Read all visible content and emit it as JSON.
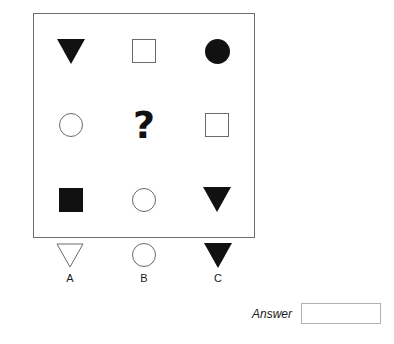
{
  "puzzle": {
    "type": "matrix-reasoning",
    "matrix": {
      "rows": 3,
      "columns": 3,
      "cells": [
        {
          "id": "r1c1",
          "shape": "triangle-down",
          "fill": "filled",
          "icon_name": "triangle-down-filled-icon"
        },
        {
          "id": "r1c2",
          "shape": "square",
          "fill": "outline",
          "icon_name": "square-outline-icon"
        },
        {
          "id": "r1c3",
          "shape": "circle",
          "fill": "filled",
          "icon_name": "circle-filled-icon"
        },
        {
          "id": "r2c1",
          "shape": "circle",
          "fill": "outline",
          "icon_name": "circle-outline-icon"
        },
        {
          "id": "r2c2",
          "shape": "question-mark",
          "fill": "none",
          "icon_name": "question-mark-icon",
          "text": "?"
        },
        {
          "id": "r2c3",
          "shape": "square",
          "fill": "outline",
          "icon_name": "square-outline-icon"
        },
        {
          "id": "r3c1",
          "shape": "square",
          "fill": "filled",
          "icon_name": "square-filled-icon"
        },
        {
          "id": "r3c2",
          "shape": "circle",
          "fill": "outline",
          "icon_name": "circle-outline-icon"
        },
        {
          "id": "r3c3",
          "shape": "triangle-down",
          "fill": "filled",
          "icon_name": "triangle-down-filled-icon"
        }
      ]
    },
    "options": [
      {
        "label": "A",
        "shape": "triangle-down",
        "fill": "outline",
        "icon_name": "triangle-down-outline-icon"
      },
      {
        "label": "B",
        "shape": "circle",
        "fill": "outline",
        "icon_name": "circle-outline-icon"
      },
      {
        "label": "C",
        "shape": "triangle-down",
        "fill": "filled",
        "icon_name": "triangle-down-filled-icon"
      }
    ],
    "answer": {
      "label": "Answer",
      "value": "",
      "placeholder": ""
    },
    "colors": {
      "fill": "#111111",
      "outline": "#6b6b6b",
      "frame": "#6e6e6e",
      "input_border": "#b0b0b0",
      "background": "#ffffff"
    }
  }
}
